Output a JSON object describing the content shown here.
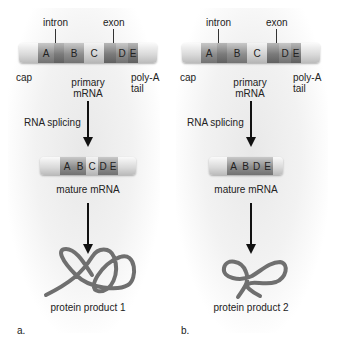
{
  "panels": [
    {
      "id": "a",
      "labels": {
        "intron": "intron",
        "exon": "exon",
        "cap": "cap",
        "primary_mrna_1": "primary",
        "primary_mrna_2": "mRNA",
        "polya_1": "poly-A",
        "polya_2": "tail",
        "splicing": "RNA splicing",
        "mature_mrna": "mature mRNA",
        "protein": "protein product 1",
        "panel_letter": "a."
      },
      "primary_segments": [
        "A",
        "B",
        "C",
        "D",
        "E"
      ],
      "mature_segments": [
        "A",
        "B",
        "C",
        "D",
        "E"
      ]
    },
    {
      "id": "b",
      "labels": {
        "intron": "intron",
        "exon": "exon",
        "cap": "cap",
        "primary_mrna_1": "primary",
        "primary_mrna_2": "mRNA",
        "polya_1": "poly-A",
        "polya_2": "tail",
        "splicing": "RNA splicing",
        "mature_mrna": "mature mRNA",
        "protein": "protein product 2",
        "panel_letter": "b."
      },
      "primary_segments": [
        "A",
        "B",
        "C",
        "D",
        "E"
      ],
      "mature_segments": [
        "A",
        "B",
        "D",
        "E"
      ]
    }
  ],
  "colors": {
    "exon_dark": "#8e8e8e",
    "intron_dark": "#7b7b7b",
    "light_segment": "#e4e4e4",
    "protein": "#6f6f6f",
    "arrow": "#111111"
  }
}
